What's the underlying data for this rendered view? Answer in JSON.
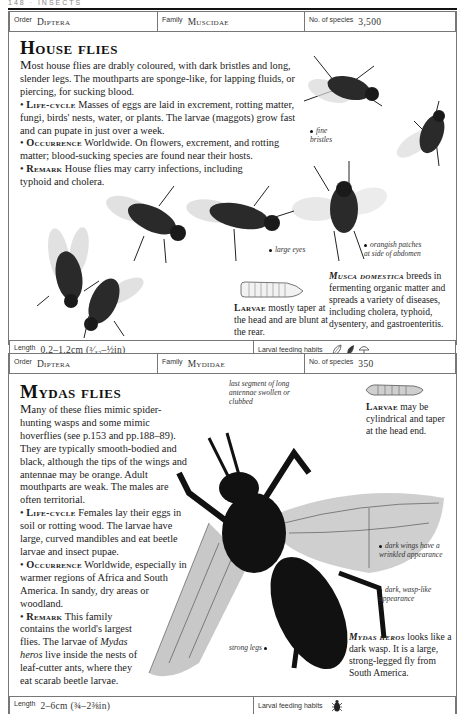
{
  "running_head": "148 · INSECTS",
  "entries": [
    {
      "info": {
        "order_label": "Order",
        "order_value": "Diptera",
        "family_label": "Family",
        "family_value": "Muscidae",
        "species_label": "No. of species",
        "species_value": "3,500"
      },
      "title": "House flies",
      "intro_first": "M",
      "intro_rest": "ost house flies are drably coloured, with dark bristles and long, slender legs. The mouthparts are sponge-like, for lapping fluids, or piercing, for sucking blood.",
      "sections": [
        {
          "heading": "Life-cycle",
          "text": "Masses of eggs are laid in excrement, rotting matter, fungi, birds' nests, water, or plants. The larvae (maggots) grow fast and can pupate in just over a week."
        },
        {
          "heading": "Occurrence",
          "text": "Worldwide. On flowers, excrement, and rotting matter; blood-sucking species are found near their hosts."
        },
        {
          "heading": "Remark",
          "text": "House flies may carry infections, including typhoid and cholera."
        }
      ],
      "callouts": {
        "fine_bristles": "fine bristles",
        "large_eyes": "large eyes",
        "orangish": "orangish patches at side of abdomen"
      },
      "larvae_caption": {
        "head": "Larvae",
        "text": "mostly taper at the head and are blunt at the rear."
      },
      "species_caption": {
        "head": "Musca domestica",
        "text": "breeds in fermenting organic matter and spreads a variety of diseases, including cholera, typhoid, dysentery, and gastroenteritis."
      },
      "footer": {
        "length_label": "Length",
        "length_value": "0.2–1.2cm (³⁄₃₂–½in)",
        "feeding_label": "Larval feeding habits",
        "feeding_icons": [
          "leaf-icon",
          "plant-icon",
          "fungus-icon"
        ]
      }
    },
    {
      "info": {
        "order_label": "Order",
        "order_value": "Diptera",
        "family_label": "Family",
        "family_value": "Mydidae",
        "species_label": "No. of species",
        "species_value": "350"
      },
      "title": "Mydas flies",
      "intro_first": "M",
      "intro_rest": "any of these flies mimic spider-hunting wasps and some mimic hoverflies (see p.153 and pp.188–89). They are typically smooth-bodied and black, although the tips of the wings and antennae may be orange. Adult mouthparts are weak. The males are often territorial.",
      "sections": [
        {
          "heading": "Life-cycle",
          "text": "Females lay their eggs in soil or rotting wood. The larvae have large, curved mandibles and eat beetle larvae and insect pupae."
        },
        {
          "heading": "Occurrence",
          "text": "Worldwide, especially in warmer regions of Africa and South America. In sandy, dry areas or woodland."
        },
        {
          "heading": "Remark",
          "text_before": "This family contains the world's largest flies. The larvae of ",
          "italic": "Mydas heros",
          "text_after": " live inside the nests of leaf-cutter ants, where they eat scarab beetle larvae."
        }
      ],
      "callouts": {
        "antennae": "last segment of long antennae swollen or clubbed",
        "dark_wings": "dark wings have a wrinkled appearance",
        "wasp_like": "dark, wasp-like appearance",
        "strong_legs": "strong legs"
      },
      "larvae_caption": {
        "head": "Larvae",
        "text": "may be cylindrical and taper at the head end."
      },
      "species_caption": {
        "head": "Mydas heros",
        "text": "looks like a dark wasp. It is a large, strong-legged fly from South America."
      },
      "footer": {
        "length_label": "Length",
        "length_value": "2–6cm (¾–2⅜in)",
        "feeding_label": "Larval feeding habits",
        "feeding_icons": [
          "beetle-icon"
        ]
      }
    }
  ]
}
